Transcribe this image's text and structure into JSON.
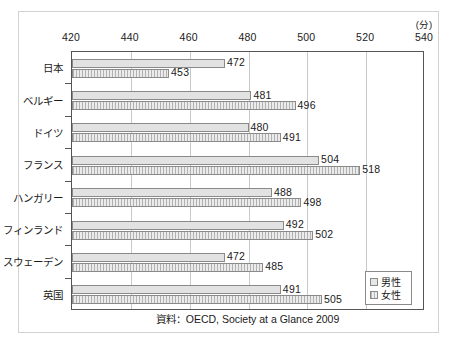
{
  "chart_data": {
    "type": "bar",
    "orientation": "horizontal",
    "title": "",
    "subtitle": "",
    "xlabel": "(分)",
    "ylabel": "",
    "xlim": [
      420,
      540
    ],
    "xticks": [
      420,
      440,
      460,
      480,
      500,
      520,
      540
    ],
    "xtick_labels": [
      "420",
      "440",
      "460",
      "480",
      "500",
      "520",
      "540"
    ],
    "grid": "vertical",
    "legend_position": "bottom-right",
    "categories": [
      "日本",
      "ベルギー",
      "ドイツ",
      "フランス",
      "ハンガリー",
      "フィンランド",
      "スウェーデン",
      "英国"
    ],
    "series": [
      {
        "name": "男性",
        "values": [
          472,
          481,
          480,
          504,
          488,
          492,
          472,
          491
        ]
      },
      {
        "name": "女性",
        "values": [
          453,
          496,
          491,
          518,
          498,
          502,
          485,
          505
        ]
      }
    ],
    "annotations": {
      "source": "資料：OECD, Society at a Glance 2009"
    },
    "colors": {
      "male_fill": "#e2e2e2",
      "female_fill": "#ebebeb",
      "bar_border": "#8a8a8a",
      "axis": "#555555",
      "gridline": "#c9c9c9",
      "text": "#1a1a1a",
      "outer_frame": "#d2d2d2"
    }
  },
  "legend": {
    "items": [
      {
        "label": "男性",
        "swatch": "male"
      },
      {
        "label": "女性",
        "swatch": "female"
      }
    ]
  },
  "source_note": "資料：OECD, Society at a Glance 2009",
  "unit_label": "(分)"
}
